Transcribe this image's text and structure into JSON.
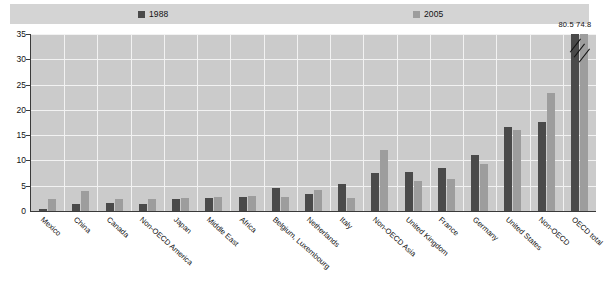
{
  "legend": {
    "items": [
      {
        "label": "1988",
        "color": "#4a4a4a",
        "name": "legend-item-1988"
      },
      {
        "label": "2005",
        "color": "#9d9d9d",
        "name": "legend-item-2005"
      }
    ]
  },
  "axis": {
    "y_ticks": [
      "0",
      "5",
      "10",
      "15",
      "20",
      "25",
      "30",
      "35"
    ],
    "y_min": 0,
    "y_max": 35
  },
  "break_annotation": {
    "value_1988": "80.5",
    "value_2005": "74.8"
  },
  "chart_data": {
    "type": "bar",
    "title": "",
    "subtitle": "",
    "xlabel": "",
    "ylabel": "",
    "ylim": [
      0,
      35
    ],
    "ytick_step": 5,
    "grid": true,
    "legend_position": "top",
    "categories": [
      "Mexico",
      "China",
      "Canada",
      "Non-OECD America",
      "Japan",
      "Middle East",
      "Africa",
      "Belgium, Luxembourg",
      "Netherlands",
      "Italy",
      "Non-OECD Asia",
      "United Kingdom",
      "France",
      "Germany",
      "United States",
      "Non-OECD",
      "OECD total"
    ],
    "series": [
      {
        "name": "1988",
        "color": "#4a4a4a",
        "values": [
          0.4,
          1.3,
          1.6,
          1.3,
          2.4,
          2.6,
          2.8,
          4.6,
          3.4,
          5.3,
          7.6,
          7.7,
          8.5,
          11.0,
          16.6,
          17.6,
          80.5
        ]
      },
      {
        "name": "2005",
        "color": "#9d9d9d",
        "values": [
          2.4,
          4.0,
          2.4,
          2.4,
          2.5,
          2.7,
          2.9,
          2.7,
          4.1,
          2.5,
          12.0,
          6.0,
          6.4,
          9.3,
          16.0,
          23.3,
          74.8
        ]
      }
    ],
    "notes": [
      "Bars for OECD total exceed the axis maximum and are truncated with a break mark; their values are labelled 80.5 (1988) and 74.8 (2005)."
    ]
  }
}
